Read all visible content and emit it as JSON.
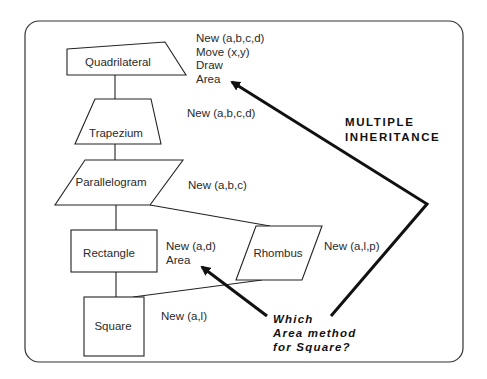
{
  "diagram": {
    "title": "MULTIPLE INHERITANCE",
    "title_lines": [
      "MULTIPLE",
      "INHERITANCE"
    ],
    "question_lines": [
      "Which",
      "Area method",
      "for Square?"
    ],
    "classes": [
      {
        "name": "Quadrilateral",
        "methods": [
          "New (a,b,c,d)",
          "Move (x,y)",
          "Draw",
          "Area"
        ]
      },
      {
        "name": "Trapezium",
        "methods": [
          "New (a,b,c,d)"
        ]
      },
      {
        "name": "Parallelogram",
        "methods": [
          "New (a,b,c)"
        ]
      },
      {
        "name": "Rectangle",
        "methods": [
          "New (a,d)",
          "Area"
        ]
      },
      {
        "name": "Rhombus",
        "methods": [
          "New (a,l,p)"
        ]
      },
      {
        "name": "Square",
        "methods": [
          "New (a,l)"
        ]
      }
    ],
    "inheritance_edges": [
      {
        "from": "Trapezium",
        "to": "Quadrilateral"
      },
      {
        "from": "Parallelogram",
        "to": "Trapezium"
      },
      {
        "from": "Rectangle",
        "to": "Parallelogram"
      },
      {
        "from": "Rhombus",
        "to": "Parallelogram"
      },
      {
        "from": "Square",
        "to": "Rectangle"
      },
      {
        "from": "Square",
        "to": "Rhombus"
      }
    ],
    "arrows": [
      {
        "from": "question",
        "to": "Quadrilateral.Area"
      },
      {
        "from": "question",
        "to": "Rectangle.Area"
      }
    ],
    "colors": {
      "stroke": "#111111",
      "text": "#2a2a2a",
      "background": "#ffffff"
    }
  }
}
